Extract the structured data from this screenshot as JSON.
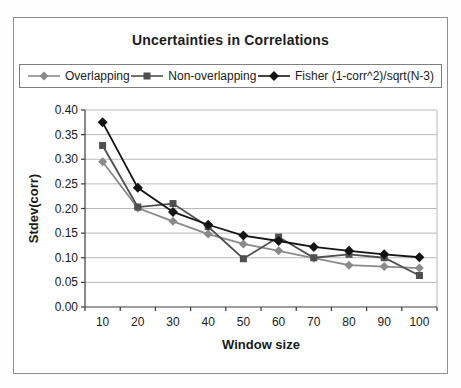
{
  "chart_data": {
    "type": "line",
    "title": "Uncertainties in Correlations",
    "xlabel": "Window size",
    "ylabel": "Stdev(corr)",
    "x": [
      10,
      20,
      30,
      40,
      50,
      60,
      70,
      80,
      90,
      100
    ],
    "xticks": [
      "10",
      "20",
      "30",
      "40",
      "50",
      "60",
      "70",
      "80",
      "90",
      "100"
    ],
    "yticks": [
      "0.00",
      "0.05",
      "0.10",
      "0.15",
      "0.20",
      "0.25",
      "0.30",
      "0.35",
      "0.40"
    ],
    "ylim": [
      0.0,
      0.4
    ],
    "ytick_step": 0.05,
    "grid": true,
    "legend_position": "top",
    "series": [
      {
        "name": "Overlapping",
        "marker": "diamond",
        "color": "#8a8a8a",
        "values": [
          0.295,
          0.201,
          0.174,
          0.148,
          0.128,
          0.114,
          0.099,
          0.085,
          0.082,
          0.079
        ]
      },
      {
        "name": "Non-overlapping",
        "marker": "square",
        "color": "#4f4f4f",
        "values": [
          0.328,
          0.203,
          0.21,
          0.163,
          0.098,
          0.142,
          0.1,
          0.107,
          0.1,
          0.064
        ]
      },
      {
        "name": "Fisher (1-corr^2)/sqrt(N-3)",
        "marker": "diamond",
        "color": "#141414",
        "values": [
          0.375,
          0.242,
          0.193,
          0.167,
          0.145,
          0.134,
          0.122,
          0.114,
          0.107,
          0.101
        ]
      }
    ],
    "colors": {
      "grid": "#b9b9b9",
      "axis": "#3c3c3c",
      "tick_text": "#1a1a1a",
      "frame_border": "#919191"
    }
  }
}
